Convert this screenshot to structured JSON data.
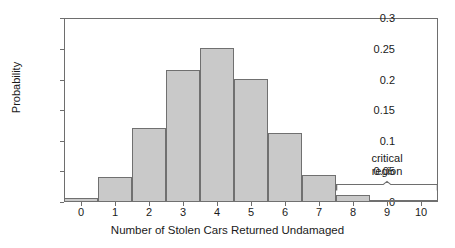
{
  "chart_data": {
    "type": "bar",
    "title": "",
    "xlabel": "Number of Stolen Cars Returned Undamaged",
    "ylabel": "Probability",
    "categories": [
      "0",
      "1",
      "2",
      "3",
      "4",
      "5",
      "6",
      "7",
      "8",
      "9",
      "10"
    ],
    "values": [
      0.006,
      0.04,
      0.121,
      0.216,
      0.251,
      0.201,
      0.113,
      0.044,
      0.011,
      0.002,
      0.0
    ],
    "xlim": [
      -0.5,
      10.5
    ],
    "ylim": [
      0,
      0.3
    ],
    "yticks": [
      0,
      0.05,
      0.1,
      0.15,
      0.2,
      0.25,
      0.3
    ],
    "ytick_labels": [
      "0",
      "0.05",
      "0.1",
      "0.15",
      "0.2",
      "0.25",
      "0.3"
    ],
    "xticks": [
      0,
      1,
      2,
      3,
      4,
      5,
      6,
      7,
      8,
      9,
      10
    ],
    "grid": false,
    "legend": null,
    "bar_fill_color": "#c9c9c9",
    "bar_edge_color": "#707070",
    "axis_color": "#6e6e6e",
    "annotations": [
      {
        "name": "critical-region",
        "lines": [
          "critical",
          "region"
        ],
        "brace_span_x": [
          7.5,
          10.5
        ]
      }
    ]
  }
}
